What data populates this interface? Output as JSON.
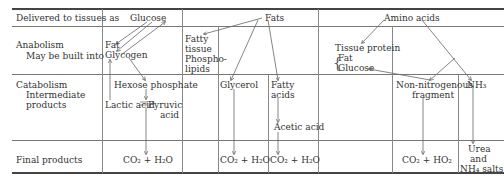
{
  "row_labels": {
    "delivered": "Delivered to tissues as",
    "anabolism": "Anabolism",
    "anabolism_sub": "May be built into",
    "catabolism": "Catabolism",
    "catabolism_sub1": "Intermediate",
    "catabolism_sub2": "products",
    "final": "Final products"
  },
  "glucose": {
    "header": "Glucose",
    "fat": "Fat",
    "glycogen": "Glycogen",
    "hexose": "Hexose phosphate",
    "lactic": "Lactic acid",
    "pyruvic1": "Pyruvic",
    "pyruvic2": "acid",
    "final": "CO₂ + H₂O"
  },
  "fats": {
    "header": "Fats",
    "fatty_tissue": [
      "Fatty",
      "tissue",
      "Phospho-",
      "lipids"
    ],
    "glycerol": "Glycerol",
    "fatty_acids1": "Fatty",
    "fatty_acids2": "acids",
    "acetic": "Acetic acid",
    "final1": "CO₂ + H₂O",
    "final2": "CO₂ + H₂O"
  },
  "amino": {
    "header": "Amino acids",
    "tissue_protein": "Tissue protein",
    "fat": "Fat",
    "glucose": "Glucose",
    "non_nitro1": "Non-nitrogenous",
    "non_nitro2": "fragment",
    "nh3": "NH₃",
    "final": "CO₂ + HO₂",
    "urea1": "Urea",
    "urea2": "and",
    "urea3": "NH₄ salts"
  }
}
